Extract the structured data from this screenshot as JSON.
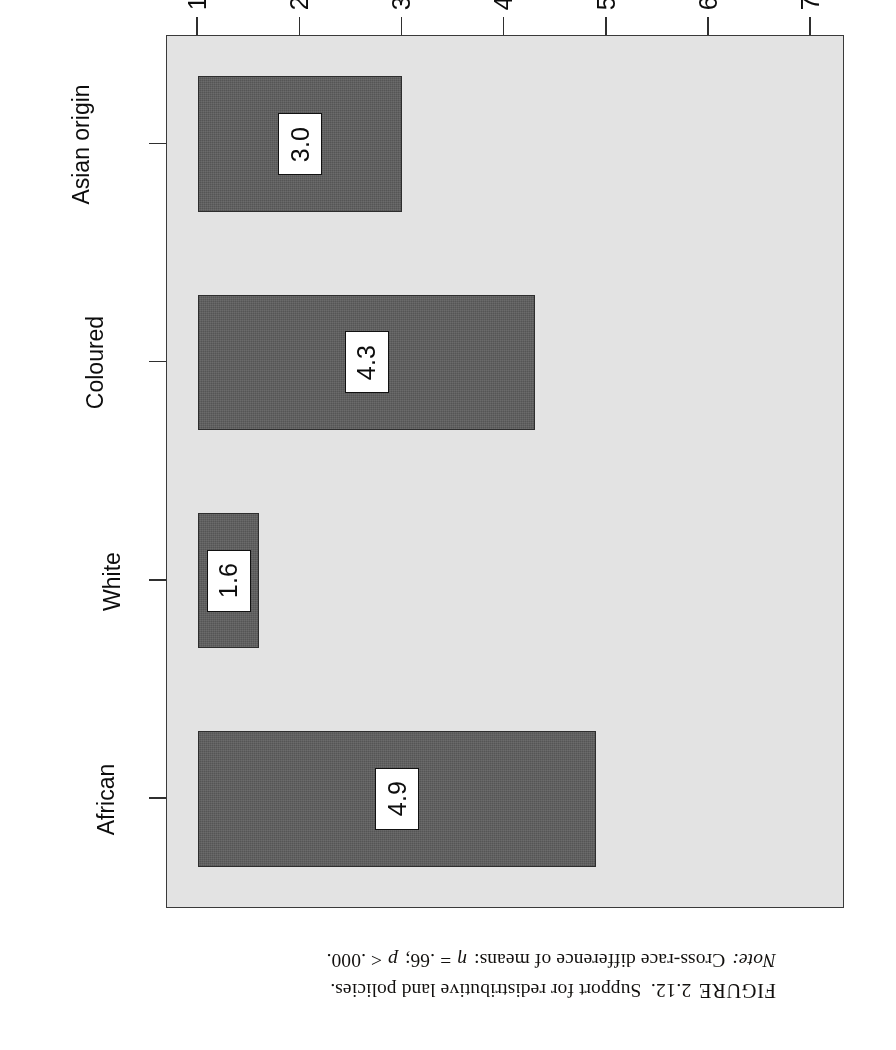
{
  "figure": {
    "caption_label": "FIGURE",
    "caption_number": "2.12.",
    "caption_text": "Support for redistributive land policies.",
    "note_label": "Note:",
    "note_text": "Cross-race difference of means:",
    "note_eta": "η",
    "note_stat": "= .66;",
    "note_p": "p",
    "note_pvalue": "< .000."
  },
  "chart_data": {
    "type": "bar",
    "orientation": "horizontal",
    "title": "",
    "categories": [
      "African",
      "White",
      "Coloured",
      "Asian origin"
    ],
    "values": [
      4.9,
      1.6,
      4.3,
      3.0
    ],
    "value_labels": [
      "4.9",
      "1.6",
      "4.3",
      "3.0"
    ],
    "xlabel": "Respondent's race",
    "ylabel": "Average number of redistributive policies supported",
    "ylim": [
      1.0,
      7.0
    ],
    "yticks": [
      1.0,
      2.0,
      3.0,
      4.0,
      5.0,
      6.0,
      7.0
    ],
    "ytick_labels": [
      "1.0",
      "2.0",
      "3.0",
      "4.0",
      "5.0",
      "6.0",
      "7.0"
    ],
    "grid": false,
    "legend": false,
    "bar_color": "#5a5a5a",
    "bar_edge_color": "#2e2e2e",
    "plot_background": "#e3e3e3",
    "figure_background": "#ffffff"
  }
}
